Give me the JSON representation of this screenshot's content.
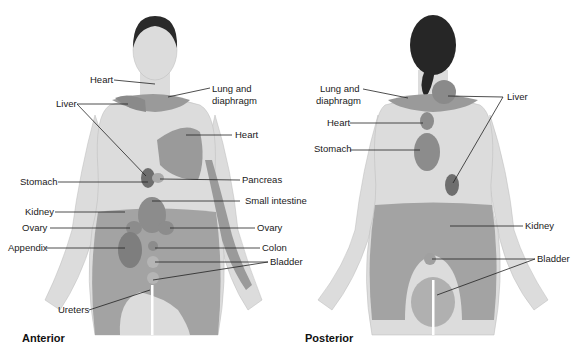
{
  "figure": {
    "views": [
      {
        "name": "Anterior",
        "labels": {
          "heart_upper": "Heart",
          "liver": "Liver",
          "lung": "Lung and",
          "lung2": "diaphragm",
          "heart_chest": "Heart",
          "stomach": "Stomach",
          "pancreas": "Pancreas",
          "small_intestine": "Small intestine",
          "kidney": "Kidney",
          "ovary_left": "Ovary",
          "ovary_right": "Ovary",
          "appendix": "Appendix",
          "colon": "Colon",
          "bladder": "Bladder",
          "ureters": "Ureters"
        }
      },
      {
        "name": "Posterior",
        "labels": {
          "lung": "Lung and",
          "lung2": "diaphragm",
          "heart": "Heart",
          "stomach": "Stomach",
          "liver": "Liver",
          "kidney": "Kidney",
          "bladder": "Bladder"
        }
      }
    ],
    "colors": {
      "skin": "#d9d9d9",
      "referred_area": "#9a9a9a",
      "dark_area": "#7a7a7a",
      "hair": "#222222"
    }
  }
}
